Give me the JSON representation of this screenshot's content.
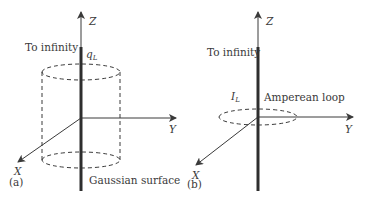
{
  "figure": {
    "colors": {
      "line": "#3a3a3a",
      "wire": "#2e2e2e",
      "background": "#ffffff"
    },
    "panel_a": {
      "caption": "(a)",
      "axes": {
        "z": "Z",
        "y": "Y",
        "x": "X"
      },
      "to_infinity": "To infinity",
      "charge_symbol": "q",
      "charge_subscript": "L",
      "surface_label": "Gaussian surface"
    },
    "panel_b": {
      "caption": "(b)",
      "axes": {
        "z": "Z",
        "y": "Y",
        "x": "X"
      },
      "to_infinity": "To infinity",
      "current_symbol": "I",
      "current_subscript": "L",
      "loop_label": "Amperean loop"
    }
  }
}
